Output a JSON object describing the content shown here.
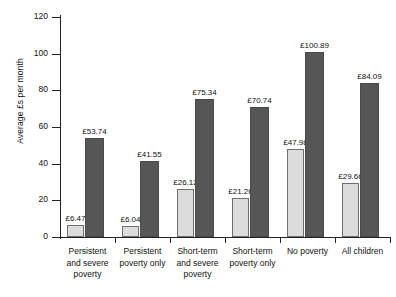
{
  "chart_data": {
    "type": "bar",
    "title": "",
    "subtitle": "",
    "xlabel": "",
    "ylabel": "Average £s per month",
    "ylim": [
      0,
      120
    ],
    "yticks": [
      0,
      20,
      40,
      60,
      80,
      100,
      120
    ],
    "ytick_labels": [
      "0",
      "20",
      "40",
      "60",
      "80",
      "100",
      "120"
    ],
    "grid": false,
    "legend": "none",
    "categories": [
      "Persistent and severe poverty",
      "Persistent poverty only",
      "Short-term and severe poverty",
      "Short-term poverty only",
      "No poverty",
      "All children"
    ],
    "category_lines": [
      [
        "Persistent",
        "and severe",
        "poverty"
      ],
      [
        "Persistent",
        "poverty only"
      ],
      [
        "Short-term",
        "and severe",
        "poverty"
      ],
      [
        "Short-term",
        "poverty only"
      ],
      [
        "No poverty"
      ],
      [
        "All children"
      ]
    ],
    "series": [
      {
        "name": "light-series",
        "color": "#dcdcdc",
        "values": [
          6.47,
          6.04,
          26.12,
          21.26,
          47.98,
          29.66
        ],
        "labels": [
          "£6.47",
          "£6.04",
          "£26.12",
          "£21.26",
          "£47.98",
          "£29.66"
        ]
      },
      {
        "name": "dark-series",
        "color": "#565656",
        "values": [
          53.74,
          41.55,
          75.34,
          70.74,
          100.89,
          84.09
        ],
        "labels": [
          "£53.74",
          "£41.55",
          "£75.34",
          "£70.74",
          "£100.89",
          "£84.09"
        ]
      }
    ]
  },
  "axis": {
    "y_title": "Average £s per month"
  }
}
